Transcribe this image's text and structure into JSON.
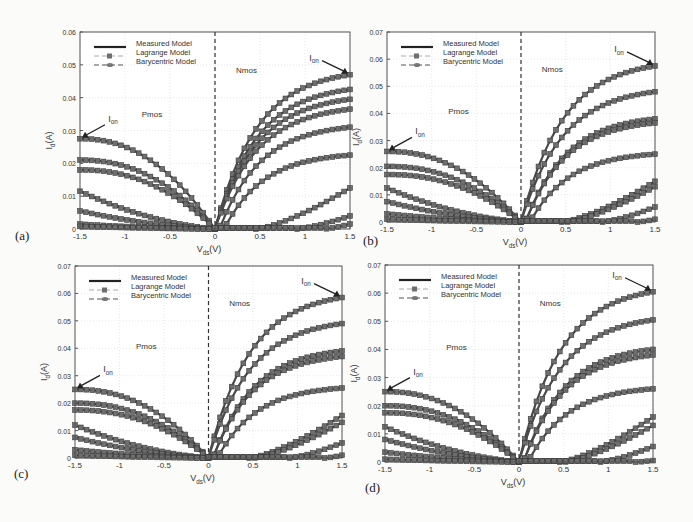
{
  "figure": {
    "legend": [
      "Measured Model",
      "Lagrange Model",
      "Barycentric Model"
    ],
    "xlabel": "V_ds(V)",
    "ylabel": "I_d(A)",
    "region_labels": {
      "pmos": "Pmos",
      "nmos": "Nmos"
    },
    "annotation": "I_on",
    "colors": {
      "curve": "#4a4a4a",
      "marker": "#6e6e6e",
      "frame": "#555555",
      "grid": "#d8d8d8"
    }
  },
  "chart_data": [
    {
      "panel": "(a)",
      "type": "line",
      "box": {
        "x": 80,
        "y": 32,
        "w": 270,
        "h": 197
      },
      "title": "",
      "xlabel": "V_ds(V)",
      "ylabel": "I_d(A)",
      "xlim": [
        -1.5,
        1.5
      ],
      "ylim": [
        0,
        0.06
      ],
      "xticks": [
        "-1.5",
        "-1",
        "-0.5",
        "0",
        "0.5",
        "1",
        "1.5"
      ],
      "yticks": [
        "0",
        "0.01",
        "0.02",
        "0.03",
        "0.04",
        "0.05",
        "0.06"
      ],
      "legend": [
        "Measured Model",
        "Lagrange Model",
        "Barycentric Model"
      ],
      "pmos_ion_at_-1.5": [
        0.0275,
        0.021,
        0.018,
        0.0115,
        0.0055,
        0.0015,
        0.0008
      ],
      "nmos_ion_at_1.5": [
        0.047,
        0.0425,
        0.0395,
        0.0365,
        0.031,
        0.0225,
        0.0125,
        0.004,
        0.0015
      ],
      "nmos_vth": [
        0.0,
        0.0,
        0.0,
        0.0,
        0.05,
        0.1,
        0.45,
        0.9,
        1.2
      ],
      "ion_nmos": 0.047,
      "ion_pmos": 0.0275,
      "grid": true,
      "legend_position": "upper left",
      "label_xy": [
        15,
        240
      ]
    },
    {
      "panel": "(b)",
      "type": "line",
      "box": {
        "x": 387,
        "y": 32,
        "w": 268,
        "h": 190
      },
      "title": "",
      "xlabel": "V_ds(V)",
      "ylabel": "I_d(A)",
      "xlim": [
        -1.5,
        1.5
      ],
      "ylim": [
        0,
        0.07
      ],
      "xticks": [
        "-1.5",
        "-1",
        "-0.5",
        "0",
        "0.5",
        "1",
        "1.5"
      ],
      "yticks": [
        "0",
        "0.01",
        "0.02",
        "0.03",
        "0.04",
        "0.05",
        "0.06",
        "0.07"
      ],
      "legend": [
        "Measured Model",
        "Lagrange Model",
        "Barycentric Model"
      ],
      "pmos_ion_at_-1.5": [
        0.026,
        0.0205,
        0.0175,
        0.0125,
        0.0075,
        0.003,
        0.001
      ],
      "nmos_ion_at_1.5": [
        0.0575,
        0.048,
        0.038,
        0.0365,
        0.025,
        0.015,
        0.013,
        0.0055,
        0.001
      ],
      "nmos_vth": [
        0.0,
        0.0,
        0.05,
        0.05,
        0.1,
        0.45,
        0.5,
        0.9,
        1.3
      ],
      "ion_nmos": 0.0575,
      "ion_pmos": 0.026,
      "grid": true,
      "legend_position": "upper left",
      "label_xy": [
        363,
        245
      ]
    },
    {
      "panel": "(c)",
      "type": "line",
      "box": {
        "x": 75,
        "y": 266,
        "w": 267,
        "h": 192
      },
      "title": "",
      "xlabel": "V_ds(V)",
      "ylabel": "I_d(A)",
      "xlim": [
        -1.5,
        1.5
      ],
      "ylim": [
        0,
        0.07
      ],
      "xticks": [
        "-1.5",
        "-1",
        "-0.5",
        "0",
        "0.5",
        "1",
        "1.5"
      ],
      "yticks": [
        "0",
        "0.01",
        "0.02",
        "0.03",
        "0.04",
        "0.05",
        "0.06",
        "0.07"
      ],
      "legend": [
        "Measured Model",
        "Lagrange Model",
        "Barycentric Model"
      ],
      "pmos_ion_at_-1.5": [
        0.025,
        0.02,
        0.0175,
        0.012,
        0.0075,
        0.003,
        0.001
      ],
      "nmos_ion_at_1.5": [
        0.0585,
        0.049,
        0.039,
        0.037,
        0.0255,
        0.0155,
        0.013,
        0.0055,
        0.001
      ],
      "nmos_vth": [
        0.0,
        0.0,
        0.05,
        0.05,
        0.1,
        0.45,
        0.5,
        0.9,
        1.3
      ],
      "ion_nmos": 0.0585,
      "ion_pmos": 0.025,
      "grid": true,
      "legend_position": "upper left",
      "label_xy": [
        14,
        478
      ]
    },
    {
      "panel": "(d)",
      "type": "line",
      "box": {
        "x": 385,
        "y": 265,
        "w": 268,
        "h": 197
      },
      "title": "",
      "xlabel": "V_ds(V)",
      "ylabel": "I_d(A)",
      "xlim": [
        -1.5,
        1.5
      ],
      "ylim": [
        0,
        0.07
      ],
      "xticks": [
        "-1.5",
        "-1",
        "-0.5",
        "0",
        "0.5",
        "1",
        "1.5"
      ],
      "yticks": [
        "0",
        "0.01",
        "0.02",
        "0.03",
        "0.04",
        "0.05",
        "0.06",
        "0.07"
      ],
      "legend": [
        "Measured Model",
        "Lagrange Model",
        "Barycentric Model"
      ],
      "pmos_ion_at_-1.5": [
        0.025,
        0.02,
        0.0175,
        0.0125,
        0.008,
        0.0035,
        0.001
      ],
      "nmos_ion_at_1.5": [
        0.0605,
        0.0505,
        0.04,
        0.038,
        0.026,
        0.016,
        0.013,
        0.0055,
        0.0005
      ],
      "nmos_vth": [
        0.0,
        0.0,
        0.05,
        0.05,
        0.1,
        0.45,
        0.5,
        0.9,
        1.3
      ],
      "ion_nmos": 0.0605,
      "ion_pmos": 0.025,
      "grid": true,
      "legend_position": "upper left",
      "label_xy": [
        365,
        492
      ]
    }
  ]
}
